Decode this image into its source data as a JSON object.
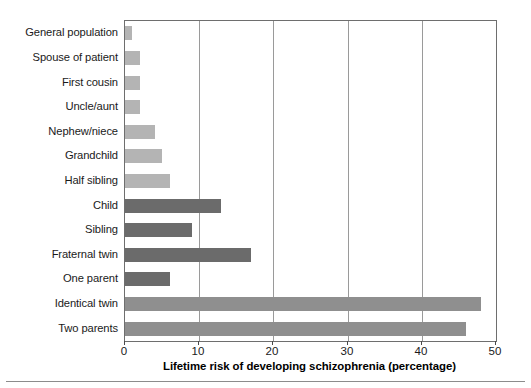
{
  "chart_data": {
    "type": "bar",
    "orientation": "horizontal",
    "title": "",
    "xlabel": "Lifetime risk of developing schizophrenia (percentage)",
    "ylabel": "",
    "xlim": [
      0,
      50
    ],
    "xticks": [
      0,
      10,
      20,
      30,
      40,
      50
    ],
    "grid": "vertical",
    "legend": "none",
    "categories": [
      "General population",
      "Spouse of patient",
      "First cousin",
      "Uncle/aunt",
      "Nephew/niece",
      "Grandchild",
      "Half sibling",
      "Child",
      "Sibling",
      "Fraternal twin",
      "One parent",
      "Identical twin",
      "Two parents"
    ],
    "values": [
      1,
      2,
      2,
      2,
      4,
      5,
      6,
      13,
      9,
      17,
      6,
      48,
      46
    ],
    "bar_colors": [
      "#b4b4b4",
      "#b4b4b4",
      "#b4b4b4",
      "#b4b4b4",
      "#b4b4b4",
      "#b4b4b4",
      "#b4b4b4",
      "#6b6b6b",
      "#6b6b6b",
      "#6b6b6b",
      "#6b6b6b",
      "#8f8f8f",
      "#8f8f8f"
    ]
  },
  "axis": {
    "tick_labels": [
      "0",
      "10",
      "20",
      "30",
      "40",
      "50"
    ],
    "x_title": "Lifetime risk of developing schizophrenia (percentage)"
  },
  "colors": {
    "light_bar": "#b4b4b4",
    "dark_bar": "#6b6b6b",
    "medium_bar": "#8f8f8f",
    "frame": "#6e6e6e",
    "gridline": "#9a9a9a",
    "text": "#1a1a1a"
  }
}
